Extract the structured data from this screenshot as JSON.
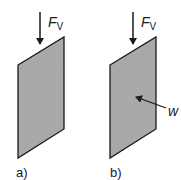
{
  "diagram": {
    "panels": [
      {
        "id": "a",
        "caption": "a)",
        "force_label": "F",
        "force_subscript": "V",
        "plate_fill": "#a9a9a9",
        "has_wind_arrow": false
      },
      {
        "id": "b",
        "caption": "b)",
        "force_label": "F",
        "force_subscript": "V",
        "plate_fill": "#a9a9a9",
        "has_wind_arrow": true,
        "wind_label": "w"
      }
    ],
    "colors": {
      "stroke": "#1a1a1a",
      "plate": "#a9a9a9",
      "background": "#ffffff"
    }
  }
}
